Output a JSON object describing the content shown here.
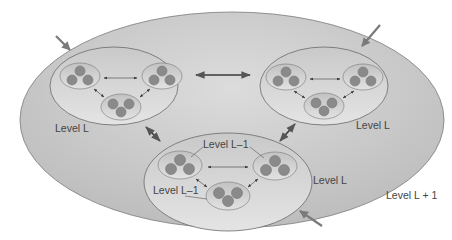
{
  "diagram": {
    "type": "hierarchical-cluster-diagram",
    "colors": {
      "outer_fill_light": "#d8d8d8",
      "outer_fill_dark": "#b8b8b8",
      "level_fill": "#d4d4d4",
      "cluster_fill": "#cfcfcf",
      "node_fill": "#8a8a8a",
      "stroke": "#6a6a6a",
      "arrow": "#3a3a3a",
      "external_arrow": "#7a7a7a",
      "text": "#444444"
    },
    "labels": {
      "outer": "Level L + 1",
      "top_left": "Level L",
      "top_right": "Level L",
      "bottom": "Level L",
      "sub_top": "Level L–1",
      "sub_left": "Level L–1"
    },
    "groups": [
      {
        "id": "top-left",
        "label": "Level L",
        "clusters": 3,
        "nodes_per_cluster": 3
      },
      {
        "id": "top-right",
        "label": "Level L",
        "clusters": 3,
        "nodes_per_cluster": 3
      },
      {
        "id": "bottom",
        "label": "Level L",
        "clusters": 3,
        "nodes_per_cluster": 3
      }
    ],
    "external_arrows": 4
  }
}
